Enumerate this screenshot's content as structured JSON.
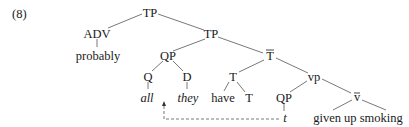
{
  "example_number": "(8)",
  "tree": {
    "nodes": {
      "tp_root": "TP",
      "adv": "ADV",
      "adv_word": "probably",
      "tp_inner": "TP",
      "qp": "QP",
      "q": "Q",
      "q_word": "all",
      "d": "D",
      "d_word": "they",
      "t_bar": "T",
      "t": "T",
      "t_word": "have",
      "t_sub": "T",
      "vp": "vp",
      "qp_trace": "QP",
      "trace": "t",
      "v_bar": "v",
      "v_word": "given up smoking"
    },
    "edges": [
      [
        "tp_root",
        "adv"
      ],
      [
        "adv",
        "adv_word"
      ],
      [
        "tp_root",
        "tp_inner"
      ],
      [
        "tp_inner",
        "qp"
      ],
      [
        "qp",
        "q"
      ],
      [
        "q",
        "q_word"
      ],
      [
        "qp",
        "d"
      ],
      [
        "d",
        "d_word"
      ],
      [
        "tp_inner",
        "t_bar"
      ],
      [
        "t_bar",
        "t"
      ],
      [
        "t",
        "t_word"
      ],
      [
        "t",
        "t_sub"
      ],
      [
        "t_bar",
        "vp"
      ],
      [
        "vp",
        "qp_trace"
      ],
      [
        "qp_trace",
        "trace"
      ],
      [
        "vp",
        "v_bar"
      ],
      [
        "v_bar",
        "v_word"
      ]
    ],
    "movement_arrow": {
      "from": "trace",
      "to": "q_word",
      "style": "dashed"
    }
  }
}
